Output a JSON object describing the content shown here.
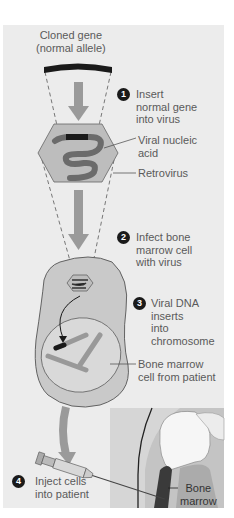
{
  "labels": {
    "cloned_gene": "Cloned gene\n(normal allele)",
    "viral_nucleic_acid": "Viral nucleic\nacid",
    "retrovirus": "Retrovirus",
    "bone_marrow_cell": "Bone marrow\ncell from patient",
    "bone_marrow": "Bone\nmarrow"
  },
  "steps": [
    {
      "number": "1",
      "text": "Insert\nnormal gene\ninto virus"
    },
    {
      "number": "2",
      "text": "Infect bone\nmarrow cell\nwith virus"
    },
    {
      "number": "3",
      "text": "Viral DNA\ninserts\ninto\nchromosome"
    },
    {
      "number": "4",
      "text": "Inject cells\ninto patient"
    }
  ],
  "colors": {
    "panel_bg": "#ececec",
    "arrow": "#9a9a9a",
    "cell_fill": "#c9c9c9",
    "virus_fill": "#bdbdbd",
    "nucleic_acid": "#6b6b6b",
    "gene": "#1a1a1a",
    "bone_marrow": "#3a3a3a",
    "inset_bg": "#bfbfbf"
  }
}
